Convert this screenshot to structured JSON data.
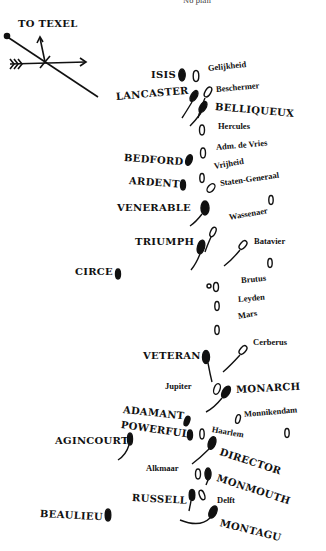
{
  "diagram": {
    "top_caption": "No plan",
    "compass": {
      "label": "TO TEXEL"
    },
    "british_ships": [
      {
        "name": "ISIS",
        "x": 151,
        "y": 76
      },
      {
        "name": "LANCASTER",
        "x": 116,
        "y": 96
      },
      {
        "name": "BELLIQUEUX",
        "x": 215,
        "y": 106
      },
      {
        "name": "BEDFORD",
        "x": 124,
        "y": 153
      },
      {
        "name": "ARDENT",
        "x": 129,
        "y": 177
      },
      {
        "name": "VENERABLE",
        "x": 117,
        "y": 205
      },
      {
        "name": "TRIUMPH",
        "x": 135,
        "y": 240
      },
      {
        "name": "CIRCE",
        "x": 75,
        "y": 269
      },
      {
        "name": "VETERAN",
        "x": 143,
        "y": 355
      },
      {
        "name": "MONARCH",
        "x": 236,
        "y": 387
      },
      {
        "name": "ADAMANT",
        "x": 123,
        "y": 407
      },
      {
        "name": "POWERFUL",
        "x": 121,
        "y": 421
      },
      {
        "name": "AGINCOURT",
        "x": 55,
        "y": 437
      },
      {
        "name": "DIRECTOR",
        "x": 220,
        "y": 447
      },
      {
        "name": "MONMOUTH",
        "x": 217,
        "y": 473
      },
      {
        "name": "RUSSELL",
        "x": 132,
        "y": 495
      },
      {
        "name": "BEAULIEU",
        "x": 40,
        "y": 510
      },
      {
        "name": "MONTAGU",
        "x": 220,
        "y": 518
      }
    ],
    "dutch_ships": [
      {
        "name": "Gelijkheid",
        "x": 208,
        "y": 64
      },
      {
        "name": "Beschermer",
        "x": 215,
        "y": 86
      },
      {
        "name": "Hercules",
        "x": 217,
        "y": 124
      },
      {
        "name": "Adm. de Vries",
        "x": 216,
        "y": 144
      },
      {
        "name": "Vrijheid",
        "x": 213,
        "y": 162
      },
      {
        "name": "Staten-Generaal",
        "x": 220,
        "y": 178
      },
      {
        "name": "Wassenaer",
        "x": 229,
        "y": 214
      },
      {
        "name": "Batavier",
        "x": 254,
        "y": 240
      },
      {
        "name": "Brutus",
        "x": 241,
        "y": 278
      },
      {
        "name": "Leyden",
        "x": 237,
        "y": 296
      },
      {
        "name": "Mars",
        "x": 237,
        "y": 313
      },
      {
        "name": "Cerberus",
        "x": 252,
        "y": 340
      },
      {
        "name": "Jupiter",
        "x": 164,
        "y": 382
      },
      {
        "name": "Monnikendam",
        "x": 244,
        "y": 410
      },
      {
        "name": "Haarlem",
        "x": 211,
        "y": 424
      },
      {
        "name": "Alkmaar",
        "x": 145,
        "y": 464
      },
      {
        "name": "Delft",
        "x": 216,
        "y": 496
      }
    ]
  }
}
